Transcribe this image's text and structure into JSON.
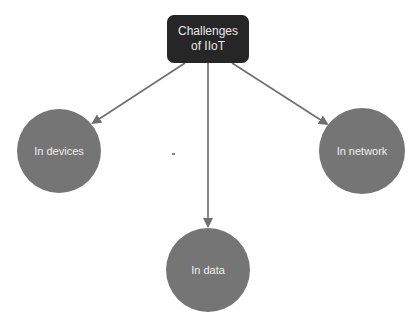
{
  "diagram": {
    "root": {
      "line1": "Challenges",
      "line2": "of IIoT"
    },
    "children": [
      {
        "id": "devices",
        "label": "In devices"
      },
      {
        "id": "network",
        "label": "In network"
      },
      {
        "id": "data",
        "label": "In data"
      }
    ],
    "colors": {
      "root_fill": "#262626",
      "node_fill": "#757575",
      "arrow": "#6e6e6e"
    }
  }
}
